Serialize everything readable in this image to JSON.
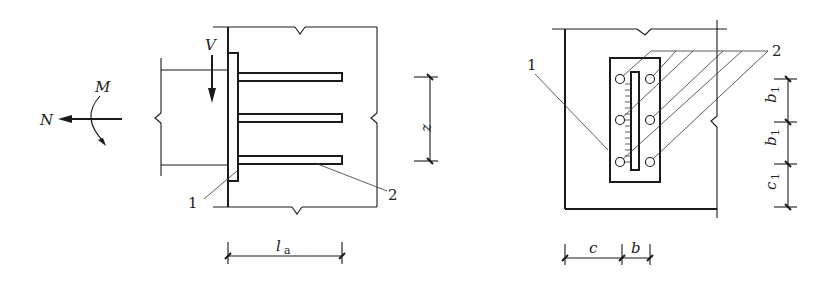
{
  "figure": {
    "type": "embedded-steel-plate-anchorage-detail",
    "left_view": {
      "name": "side-elevation",
      "loads": {
        "shear": "V",
        "moment": "M",
        "axial": "N"
      },
      "anchor_bar_count": 3,
      "callouts": [
        "1",
        "2"
      ],
      "dimensions": {
        "anchorage_length": {
          "symbol": "l",
          "subscript": "a"
        },
        "lever_arm": "z"
      }
    },
    "right_view": {
      "name": "front-elevation",
      "callouts": [
        "1",
        "2"
      ],
      "anchor_rows": 3,
      "anchor_columns": 2,
      "dimensions": {
        "edge_horizontal": "c",
        "bar_spacing_horizontal": "b",
        "row_spacing_1": {
          "symbol": "b",
          "subscript": "1"
        },
        "row_spacing_2": {
          "symbol": "b",
          "subscript": "1"
        },
        "edge_vertical": {
          "symbol": "c",
          "subscript": "1"
        }
      }
    },
    "colors": {
      "ink": "#1a1a1a",
      "background": "#ffffff"
    }
  }
}
